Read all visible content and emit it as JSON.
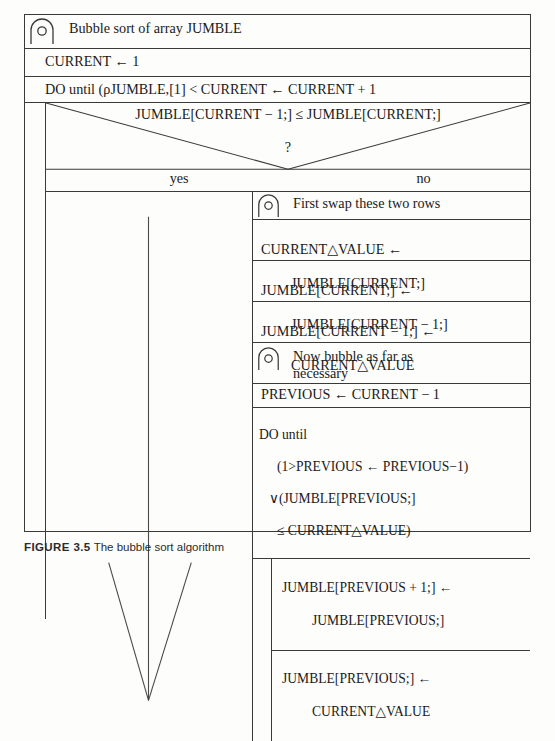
{
  "figure": {
    "caption_label": "FIGURE 3.5",
    "caption_text": "The bubble sort algorithm",
    "icon": "comment-arch-icon"
  },
  "diagram": {
    "type": "nassi-shneiderman",
    "title_comment": "Bubble sort of array JUMBLE",
    "init_statement": "CURRENT ← 1",
    "outer_loop": {
      "header": "DO until (ρJUMBLE,[1] < CURRENT ← CURRENT + 1",
      "decision": {
        "condition": "JUMBLE[CURRENT − 1;] ≤ JUMBLE[CURRENT;]",
        "question_mark": "?",
        "yes_label": "yes",
        "no_label": "no"
      },
      "yes_branch": {
        "content": "down-arrow"
      },
      "no_branch": {
        "comment_swap": "First swap these two rows",
        "swap_steps": [
          {
            "line1": "CURRENT△VALUE ←",
            "line2": "JUMBLE[CURRENT;]"
          },
          {
            "line1": "JUMBLE[CURRENT;] ←",
            "line2": "JUMBLE[CURRENT − 1;]"
          },
          {
            "line1": "JUMBLE[CURRENT − 1;] ←",
            "line2": "CURRENT△VALUE"
          }
        ],
        "comment_bubble": "Now bubble as far as\nnecessary",
        "previous_init": "PREVIOUS ← CURRENT − 1",
        "inner_loop": {
          "header_line1": "DO until",
          "header_line2": "(1>PREVIOUS ← PREVIOUS−1)",
          "header_line3": "∨(JUMBLE[PREVIOUS;]",
          "header_line4": "≤ CURRENT△VALUE)",
          "body": [
            {
              "line1": "JUMBLE[PREVIOUS + 1;] ←",
              "line2": "JUMBLE[PREVIOUS;]"
            },
            {
              "line1": "JUMBLE[PREVIOUS;] ←",
              "line2": "CURRENT△VALUE"
            }
          ]
        }
      }
    }
  },
  "colors": {
    "ink": "#1a1a1a",
    "rule": "#3a3a3a",
    "paper": "#fdfdfb"
  }
}
